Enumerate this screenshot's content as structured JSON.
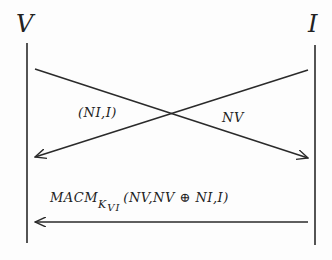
{
  "diagram": {
    "type": "sequence-protocol",
    "participants": [
      {
        "id": "V",
        "label": "V"
      },
      {
        "id": "I",
        "label": "I"
      }
    ],
    "messages": [
      {
        "from": "I",
        "to": "V",
        "label": "(NI,I)"
      },
      {
        "from": "V",
        "to": "I",
        "label": "NV"
      },
      {
        "from": "I",
        "to": "V",
        "label_main": "MACM",
        "label_subscript": "K",
        "label_subscript2": "VI",
        "label_args": "(NV,NV ⊕ NI,I)"
      }
    ],
    "colors": {
      "line": "#2a2a2a",
      "text": "#222222",
      "background": "#fdfdfd"
    }
  }
}
